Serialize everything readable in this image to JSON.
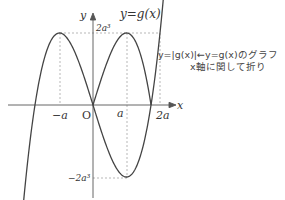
{
  "figure": {
    "curve_label": "y=g(x)",
    "axis_x_label": "x",
    "axis_y_label": "y",
    "origin_label": "O",
    "tick_labels": {
      "neg_a": "−a",
      "a": "a",
      "two_a": "2a",
      "two_a_cubed": "2a³",
      "neg_two_a_cubed": "−2a³"
    },
    "annotation_line1": "y=|g(x)|←y=g(x)のグラフ",
    "annotation_line2": "x軸に関して折り"
  },
  "colors": {
    "curve": "#444444",
    "axes": "#555555",
    "dashed": "#888888",
    "background": "#ffffff"
  }
}
